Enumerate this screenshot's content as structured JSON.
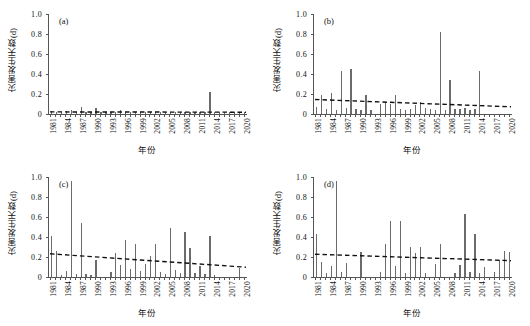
{
  "figure": {
    "width": 530,
    "height": 326,
    "bar_color": "#6b6b6b",
    "axis_color": "#555555",
    "trend_color": "#111111"
  },
  "axes": {
    "ylabel": "灾害发生天数(d)",
    "xlabel": "年份",
    "yticks": [
      "1.0",
      "0.8",
      "0.6",
      "0.4",
      "0.2",
      "0"
    ],
    "yvalues": [
      1.0,
      0.8,
      0.6,
      0.4,
      0.2,
      0
    ],
    "ylim": [
      0,
      1.0
    ],
    "xlim": [
      1981,
      2020
    ],
    "xticks": [
      "1981",
      "1984",
      "1987",
      "1990",
      "1993",
      "1996",
      "1999",
      "2002",
      "2005",
      "2008",
      "2011",
      "2014",
      "2017",
      "2020"
    ],
    "xtickvalues": [
      1981,
      1984,
      1987,
      1990,
      1993,
      1996,
      1999,
      2002,
      2005,
      2008,
      2011,
      2014,
      2017,
      2020
    ],
    "grid": false,
    "legend": "none"
  },
  "chart_data": [
    {
      "type": "bar",
      "panel": "(a)",
      "title": "",
      "xlabel": "年份",
      "ylabel": "灾害发生天数(d)",
      "ylim": [
        0,
        1.0
      ],
      "xlim": [
        1981,
        2020
      ],
      "categories": [
        1981,
        1982,
        1983,
        1984,
        1985,
        1986,
        1987,
        1988,
        1989,
        1990,
        1991,
        1992,
        1993,
        1994,
        1995,
        1996,
        1997,
        1998,
        1999,
        2000,
        2001,
        2002,
        2003,
        2004,
        2005,
        2006,
        2007,
        2008,
        2009,
        2010,
        2011,
        2012,
        2013,
        2014,
        2015,
        2016,
        2017,
        2018,
        2019,
        2020
      ],
      "values": [
        0.03,
        0.02,
        0.02,
        0.03,
        0.04,
        0.02,
        0.07,
        0.02,
        0.02,
        0.06,
        0.02,
        0.02,
        0.02,
        0.02,
        0.04,
        0.02,
        0.02,
        0.02,
        0.02,
        0.02,
        0.02,
        0.02,
        0.02,
        0.02,
        0.02,
        0.02,
        0.02,
        0.02,
        0.02,
        0.02,
        0.02,
        0.02,
        0.22,
        0.02,
        0.02,
        0.02,
        0.02,
        0.02,
        0.02,
        0.02
      ],
      "trend": {
        "type": "linear-dashed",
        "y_start": 0.021,
        "y_end": 0.018
      }
    },
    {
      "type": "bar",
      "panel": "(b)",
      "title": "",
      "xlabel": "年份",
      "ylabel": "灾害发生天数(d)",
      "ylim": [
        0,
        1.0
      ],
      "xlim": [
        1981,
        2020
      ],
      "categories": [
        1981,
        1982,
        1983,
        1984,
        1985,
        1986,
        1987,
        1988,
        1989,
        1990,
        1991,
        1992,
        1993,
        1994,
        1995,
        1996,
        1997,
        1998,
        1999,
        2000,
        2001,
        2002,
        2003,
        2004,
        2005,
        2006,
        2007,
        2008,
        2009,
        2010,
        2011,
        2012,
        2013,
        2014,
        2015,
        2016,
        2017,
        2018,
        2019,
        2020
      ],
      "values": [
        0.07,
        0.19,
        0.05,
        0.21,
        0.04,
        0.43,
        0.06,
        0.45,
        0.05,
        0.04,
        0.19,
        0.04,
        0.0,
        0.1,
        0.12,
        0.1,
        0.19,
        0.05,
        0.04,
        0.05,
        0.09,
        0.12,
        0.06,
        0.05,
        0.04,
        0.82,
        0.04,
        0.34,
        0.05,
        0.05,
        0.06,
        0.04,
        0.05,
        0.43,
        0.0,
        0.0,
        0.0,
        0.0,
        0.0,
        0.0
      ],
      "trend": {
        "type": "linear-dashed",
        "y_start": 0.145,
        "y_end": 0.072
      }
    },
    {
      "type": "bar",
      "panel": "(c)",
      "title": "",
      "xlabel": "年份",
      "ylabel": "灾害发生天数(d)",
      "ylim": [
        0,
        1.0
      ],
      "xlim": [
        1981,
        2020
      ],
      "categories": [
        1981,
        1982,
        1983,
        1984,
        1985,
        1986,
        1987,
        1988,
        1989,
        1990,
        1991,
        1992,
        1993,
        1994,
        1995,
        1996,
        1997,
        1998,
        1999,
        2000,
        2001,
        2002,
        2003,
        2004,
        2005,
        2006,
        2007,
        2008,
        2009,
        2010,
        2011,
        2012,
        2013,
        2014,
        2015,
        2016,
        2017,
        2018,
        2019,
        2020
      ],
      "values": [
        0.41,
        0.26,
        0.02,
        0.06,
        0.96,
        0.03,
        0.54,
        0.03,
        0.02,
        0.17,
        0.0,
        0.0,
        0.05,
        0.24,
        0.12,
        0.37,
        0.08,
        0.33,
        0.06,
        0.13,
        0.21,
        0.33,
        0.05,
        0.03,
        0.49,
        0.07,
        0.04,
        0.45,
        0.29,
        0.04,
        0.11,
        0.03,
        0.41,
        0.02,
        0.0,
        0.0,
        0.0,
        0.0,
        0.09,
        0.0
      ],
      "trend": {
        "type": "linear-dashed",
        "y_start": 0.232,
        "y_end": 0.098
      }
    },
    {
      "type": "bar",
      "panel": "(d)",
      "title": "",
      "xlabel": "年份",
      "ylabel": "灾害发生天数(d)",
      "ylim": [
        0,
        1.0
      ],
      "xlim": [
        1981,
        2020
      ],
      "categories": [
        1981,
        1982,
        1983,
        1984,
        1985,
        1986,
        1987,
        1988,
        1989,
        1990,
        1991,
        1992,
        1993,
        1994,
        1995,
        1996,
        1997,
        1998,
        1999,
        2000,
        2001,
        2002,
        2003,
        2004,
        2005,
        2006,
        2007,
        2008,
        2009,
        2010,
        2011,
        2012,
        2013,
        2014,
        2015,
        2016,
        2017,
        2018,
        2019,
        2020
      ],
      "values": [
        0.43,
        0.15,
        0.04,
        0.11,
        0.96,
        0.05,
        0.14,
        0.0,
        0.0,
        0.25,
        0.0,
        0.0,
        0.0,
        0.05,
        0.33,
        0.56,
        0.11,
        0.56,
        0.04,
        0.3,
        0.24,
        0.3,
        0.04,
        0.0,
        0.13,
        0.33,
        0.0,
        0.0,
        0.04,
        0.12,
        0.63,
        0.05,
        0.43,
        0.04,
        0.1,
        0.0,
        0.05,
        0.17,
        0.26,
        0.25
      ],
      "trend": {
        "type": "linear-dashed",
        "y_start": 0.228,
        "y_end": 0.163
      }
    }
  ]
}
